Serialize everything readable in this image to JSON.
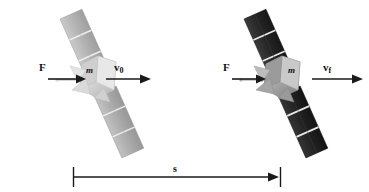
{
  "figure": {
    "background_color": "#ffffff",
    "ink_color": "#1a1a1a",
    "width": 369,
    "height": 192
  },
  "labels": {
    "force_left": "F",
    "force_right": "F",
    "velocity_initial_symbol": "v",
    "velocity_initial_subscript": "0",
    "velocity_final_symbol": "v",
    "velocity_final_subscript": "f",
    "mass_left": "m",
    "mass_right": "m",
    "displacement": "s"
  },
  "objects": [
    {
      "name": "satellite-initial",
      "panel_color": "#b9b9b9",
      "panel_color_dark": "#a6a6a6",
      "body_color": "#dcdcdc",
      "state": "initial",
      "mass_label": "m",
      "velocity_label": "v0"
    },
    {
      "name": "satellite-final",
      "panel_color": "#2d2d2d",
      "panel_color_dark": "#1e1e1e",
      "body_color": "#b8b8b8",
      "state": "final",
      "mass_label": "m",
      "velocity_label": "vf"
    }
  ],
  "vectors": [
    {
      "name": "force-left",
      "label": "F",
      "direction": "right",
      "x1": 48,
      "x2": 82,
      "y": 79
    },
    {
      "name": "velocity-initial",
      "label": "v0",
      "direction": "right",
      "x1": 106,
      "x2": 148,
      "y": 79
    },
    {
      "name": "force-right",
      "label": "F",
      "direction": "right",
      "x1": 232,
      "x2": 263,
      "y": 79
    },
    {
      "name": "velocity-final",
      "label": "vf",
      "direction": "right",
      "x1": 312,
      "x2": 360,
      "y": 79
    }
  ],
  "measure": {
    "name": "displacement-s",
    "label": "s",
    "x_start": 73,
    "x_end": 279,
    "y": 177,
    "tick_top": 167,
    "tick_bottom": 187
  }
}
